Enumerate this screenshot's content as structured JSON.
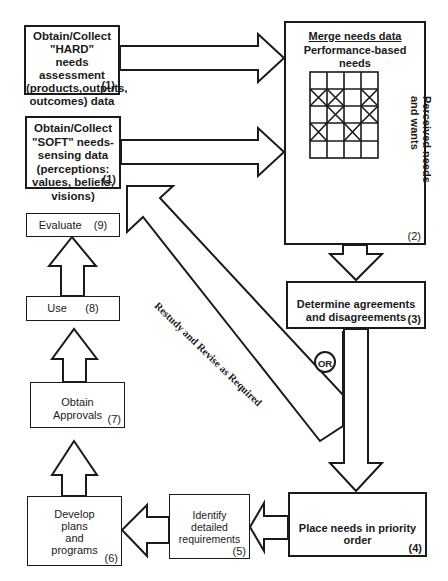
{
  "diagram": {
    "boxes": {
      "hard": {
        "label": "Obtain/Collect\n\"HARD\"\nneeds assessment\n(products,outputs,\noutcomes) data",
        "num": "(1)"
      },
      "soft": {
        "label": "Obtain/Collect\n\"SOFT\" needs-\nsensing data\n(perceptions:\nvalues, beliefs,\nvisions)",
        "num": "(1)"
      },
      "merge": {
        "title": "Merge needs data",
        "top_label": "Performance-based\nneeds",
        "side_label": "Perceived needs\nand wants",
        "num": "(2)",
        "grid": [
          [
            0,
            0,
            0,
            0
          ],
          [
            1,
            1,
            0,
            1
          ],
          [
            0,
            1,
            0,
            1
          ],
          [
            1,
            0,
            1,
            0
          ],
          [
            0,
            0,
            0,
            0
          ]
        ]
      },
      "agree": {
        "label": "Determine agreements\nand disagreements",
        "num": "(3)"
      },
      "priority": {
        "label": "Place needs in priority order",
        "num": "(4)"
      },
      "requirements": {
        "label": "Identify\ndetailed\nrequirements",
        "num": "(5)"
      },
      "develop": {
        "label": "Develop\nplans\nand\nprograms",
        "num": "(6)"
      },
      "approvals": {
        "label": "Obtain\nApprovals",
        "num": "(7)"
      },
      "use": {
        "label": "Use      (8)"
      },
      "evaluate": {
        "label": "Evaluate    (9)"
      }
    },
    "restudy_label": "Restudy and Revise as Required",
    "or_label": "OR"
  }
}
